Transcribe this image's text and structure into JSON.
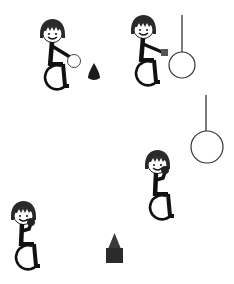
{
  "scene": {
    "description": "Pictograms of a child in a wheelchair interacting with objects",
    "colors": {
      "ink": "#111111",
      "outline": "#333333",
      "hair": "#2a2a2a",
      "skin": "#ffffff",
      "object_dark": "#2b2b2b",
      "held_square": "#555555"
    },
    "figures": [
      {
        "id": "figure-1",
        "action": "reaching-ball",
        "held_object": "white-ball"
      },
      {
        "id": "figure-2",
        "action": "reaching-ring",
        "held_object": "small-square"
      },
      {
        "id": "figure-3",
        "action": "holding-ball-up",
        "held_object": "dark-ball"
      },
      {
        "id": "figure-4",
        "action": "holding-ball-up",
        "held_object": "dark-ball"
      }
    ],
    "objects": [
      {
        "id": "cone",
        "icon": "cone-icon"
      },
      {
        "id": "hanging-ring-1",
        "icon": "hanging-ring-icon"
      },
      {
        "id": "hanging-ring-2",
        "icon": "hanging-ring-icon"
      },
      {
        "id": "block-with-cone",
        "icon": "block-icon"
      }
    ]
  }
}
